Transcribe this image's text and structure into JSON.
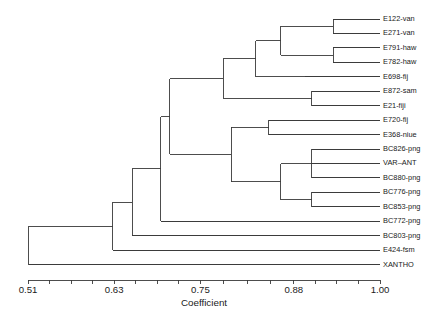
{
  "chart_data": {
    "type": "dendrogram",
    "title": "",
    "xlabel": "Coefficient",
    "ylabel": "",
    "xlim": [
      0.51,
      1.0
    ],
    "grid": false,
    "legend": "none",
    "tick_labels": [
      "0.51",
      "0.63",
      "0.75",
      "0.88",
      "1.00"
    ],
    "tick_values": [
      0.51,
      0.63,
      0.75,
      0.88,
      1.0
    ],
    "minor_ticks_per_interval": 3,
    "leaves": [
      {
        "label": "E122-van",
        "merge_coefficient": 0.935
      },
      {
        "label": "E271-van",
        "merge_coefficient": 0.935
      },
      {
        "label": "E791-haw",
        "merge_coefficient": 0.935
      },
      {
        "label": "E782-haw",
        "merge_coefficient": 0.935
      },
      {
        "label": "E698-fij",
        "merge_coefficient": 0.895
      },
      {
        "label": "E872-sam",
        "merge_coefficient": 0.905
      },
      {
        "label": "E21-fiji",
        "merge_coefficient": 0.905
      },
      {
        "label": "E720-fij",
        "merge_coefficient": 0.845
      },
      {
        "label": "E368-niue",
        "merge_coefficient": 0.845
      },
      {
        "label": "BC826-png",
        "merge_coefficient": 0.905
      },
      {
        "label": "VAR–ANT",
        "merge_coefficient": 0.905
      },
      {
        "label": "BC880-png",
        "merge_coefficient": 0.905
      },
      {
        "label": "BC776-png",
        "merge_coefficient": 0.905
      },
      {
        "label": "BC853-png",
        "merge_coefficient": 0.905
      },
      {
        "label": "BC772-png",
        "merge_coefficient": 0.695
      },
      {
        "label": "BC803-png",
        "merge_coefficient": 0.655
      },
      {
        "label": "E424-fsm",
        "merge_coefficient": 0.628
      },
      {
        "label": "XANTHO",
        "merge_coefficient": 0.511
      }
    ],
    "nodes": [
      {
        "id": "n1",
        "coefficient": 0.935,
        "children": [
          "E122-van",
          "E271-van"
        ]
      },
      {
        "id": "n2",
        "coefficient": 0.935,
        "children": [
          "E791-haw",
          "E782-haw"
        ]
      },
      {
        "id": "n3",
        "coefficient": 0.862,
        "children": [
          "n1",
          "n2"
        ]
      },
      {
        "id": "n4",
        "coefficient": 0.827,
        "children": [
          "n3",
          "E698-fij"
        ]
      },
      {
        "id": "n5",
        "coefficient": 0.905,
        "children": [
          "E872-sam",
          "E21-fiji"
        ]
      },
      {
        "id": "n6",
        "coefficient": 0.782,
        "children": [
          "n4",
          "n5"
        ]
      },
      {
        "id": "n7",
        "coefficient": 0.845,
        "children": [
          "E720-fij",
          "E368-niue"
        ]
      },
      {
        "id": "n8",
        "coefficient": 0.905,
        "children": [
          "BC826-png",
          "VAR–ANT",
          "BC880-png"
        ]
      },
      {
        "id": "n9",
        "coefficient": 0.905,
        "children": [
          "BC776-png",
          "BC853-png"
        ]
      },
      {
        "id": "n10",
        "coefficient": 0.862,
        "children": [
          "n8",
          "n9"
        ]
      },
      {
        "id": "n11",
        "coefficient": 0.793,
        "children": [
          "n7",
          "n10"
        ]
      },
      {
        "id": "n12",
        "coefficient": 0.707,
        "children": [
          "n6",
          "n11"
        ]
      },
      {
        "id": "n13",
        "coefficient": 0.695,
        "children": [
          "n12",
          "BC772-png"
        ]
      },
      {
        "id": "n14",
        "coefficient": 0.655,
        "children": [
          "n13",
          "BC803-png"
        ]
      },
      {
        "id": "n15",
        "coefficient": 0.628,
        "children": [
          "n14",
          "E424-fsm"
        ]
      },
      {
        "id": "n16",
        "coefficient": 0.511,
        "children": [
          "n15",
          "XANTHO"
        ]
      }
    ]
  },
  "layout": {
    "plot_left": 28,
    "plot_right": 380,
    "first_leaf_y": 19,
    "leaf_spacing": 14.45,
    "axis_y": 280,
    "tick_length": 4,
    "label_offset": 3,
    "axis_title_y": 306,
    "tick_label_y": 293
  },
  "colors": {
    "line": "#3a3a3a",
    "text": "#1a1a1a",
    "background": "#ffffff"
  }
}
